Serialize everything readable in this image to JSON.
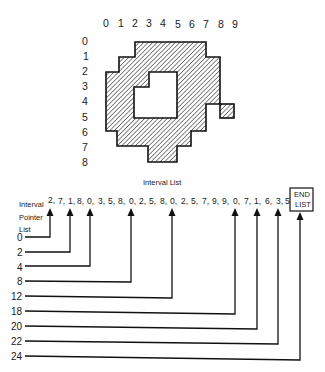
{
  "grid": {
    "column_labels": [
      "0",
      "1",
      "2",
      "3",
      "4",
      "5",
      "6",
      "7",
      "8",
      "9"
    ],
    "row_labels": [
      "0",
      "1",
      "2",
      "3",
      "4",
      "5",
      "6",
      "7",
      "8"
    ]
  },
  "shape": {
    "fill_pattern": "diagonal-hatch",
    "stroke_color": "#111111"
  },
  "interval_list": {
    "title": "Interval List",
    "values": [
      "2,",
      "7,",
      "1,",
      "8,",
      "0,",
      "3,",
      "5,",
      "8,",
      "0,",
      "2,",
      "5,",
      "8,",
      "0,",
      "2,",
      "5,",
      "7,",
      "9,",
      "9,",
      "0,",
      "7,",
      "1,",
      "6,",
      "3,",
      "5"
    ],
    "end_label_line1": "END",
    "end_label_line2": "LIST"
  },
  "pointer_list": {
    "label_line1": "Interval",
    "label_line2": "Pointer",
    "label_line3": "List",
    "pointers": [
      "0",
      "2",
      "4",
      "8",
      "12",
      "18",
      "20",
      "22",
      "24"
    ]
  }
}
